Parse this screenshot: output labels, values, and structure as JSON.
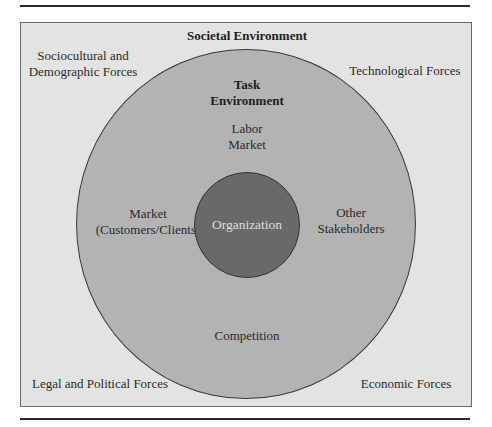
{
  "diagram": {
    "title": "Societal Environment",
    "colors": {
      "outer_box": "#e3e3e3",
      "task_circle": "#b3b3b3",
      "organization_circle": "#696969",
      "organization_text": "#dedede",
      "rules": "#2b2b2b"
    },
    "societal_forces": {
      "top_left": [
        "Sociocultural and",
        "Demographic Forces"
      ],
      "top_right": [
        "Technological Forces"
      ],
      "bottom_left": [
        "Legal and Political Forces"
      ],
      "bottom_right": [
        "Economic Forces"
      ]
    },
    "task_environment": {
      "title": [
        "Task",
        "Environment"
      ],
      "top": [
        "Labor",
        "Market"
      ],
      "left": [
        "Market",
        "(Customers/Clients)"
      ],
      "right": [
        "Other",
        "Stakeholders"
      ],
      "bottom": [
        "Competition"
      ]
    },
    "organization": {
      "label": "Organization"
    }
  }
}
